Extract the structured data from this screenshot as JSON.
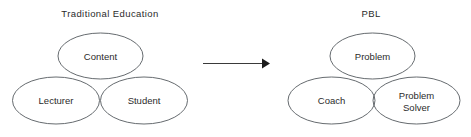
{
  "canvas": {
    "width": 471,
    "height": 137,
    "background": "#ffffff",
    "stroke_color": "#555a5f",
    "text_color": "#2b2b2b",
    "arrow_color": "#1c1c1c"
  },
  "diagrams": [
    {
      "id": "traditional-education",
      "title": "Traditional  Education",
      "title_x": 110,
      "title_y": 17,
      "nodes": [
        {
          "id": "content",
          "label": "Content",
          "cx": 100.5,
          "cy": 56,
          "rx": 42.5,
          "ry": 23,
          "label_x": 100.5,
          "label_y": 59.5,
          "lines": [
            "Content"
          ]
        },
        {
          "id": "lecturer",
          "label": "Lecturer",
          "cx": 56,
          "cy": 100.5,
          "rx": 43.5,
          "ry": 23.5,
          "label_x": 56,
          "label_y": 104,
          "lines": [
            "Lecturer"
          ]
        },
        {
          "id": "student",
          "label": "Student",
          "cx": 144,
          "cy": 100.5,
          "rx": 43.5,
          "ry": 23.5,
          "label_x": 144,
          "label_y": 104,
          "lines": [
            "Student"
          ]
        }
      ]
    },
    {
      "id": "pbl",
      "title": "PBL",
      "title_x": 371,
      "title_y": 17,
      "nodes": [
        {
          "id": "problem",
          "label": "Problem",
          "cx": 372.5,
          "cy": 56,
          "rx": 42.5,
          "ry": 23,
          "label_x": 372.5,
          "label_y": 59.5,
          "lines": [
            "Problem"
          ]
        },
        {
          "id": "coach",
          "label": "Coach",
          "cx": 331.5,
          "cy": 100.5,
          "rx": 43.5,
          "ry": 23.5,
          "label_x": 331.5,
          "label_y": 104,
          "lines": [
            "Coach"
          ]
        },
        {
          "id": "problem-solver",
          "label": "Problem Solver",
          "cx": 416.5,
          "cy": 100.5,
          "rx": 43.5,
          "ry": 23.5,
          "label_x": 416.5,
          "label_y": 99,
          "lines": [
            "Problem",
            "Solver"
          ]
        }
      ]
    }
  ],
  "arrow": {
    "id": "transition-arrow",
    "x1": 203,
    "y1": 63.5,
    "x2": 262,
    "y2": 63.5,
    "head_points": "262,58.5 270,63.5 262,68.5"
  }
}
